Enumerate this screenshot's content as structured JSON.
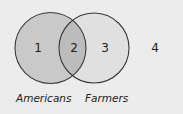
{
  "diagram": {
    "type": "venn",
    "colors": {
      "background": "#ececec",
      "left_fill": "#c9c9c9",
      "right_fill": "#e0e0e0",
      "intersection_fill": "#bcbcbc",
      "stroke": "#3a3a3a",
      "text": "#222222"
    },
    "sets": [
      {
        "label": "Americans"
      },
      {
        "label": "Farmers"
      }
    ],
    "regions": [
      {
        "id": "1",
        "label": "1",
        "description": "Americans only"
      },
      {
        "id": "2",
        "label": "2",
        "description": "Americans and Farmers"
      },
      {
        "id": "3",
        "label": "3",
        "description": "Farmers only"
      },
      {
        "id": "4",
        "label": "4",
        "description": "Neither"
      }
    ]
  }
}
